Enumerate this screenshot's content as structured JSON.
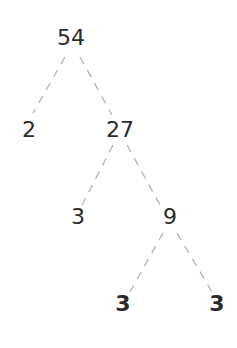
{
  "diagram": {
    "type": "factor-tree",
    "root": "54",
    "nodes": [
      {
        "id": "n54",
        "label": "54",
        "x": 71,
        "y": 38,
        "bold": false
      },
      {
        "id": "n2",
        "label": "2",
        "x": 29,
        "y": 130,
        "bold": false
      },
      {
        "id": "n27",
        "label": "27",
        "x": 120,
        "y": 130,
        "bold": false
      },
      {
        "id": "n3a",
        "label": "3",
        "x": 78,
        "y": 217,
        "bold": false
      },
      {
        "id": "n9",
        "label": "9",
        "x": 170,
        "y": 217,
        "bold": false
      },
      {
        "id": "n3b",
        "label": "3",
        "x": 123,
        "y": 304,
        "bold": true
      },
      {
        "id": "n3c",
        "label": "3",
        "x": 217,
        "y": 304,
        "bold": true
      }
    ],
    "edges": [
      {
        "from": "54",
        "to": "2",
        "x1": 65,
        "y1": 57,
        "x2": 33,
        "y2": 113
      },
      {
        "from": "54",
        "to": "27",
        "x1": 80,
        "y1": 57,
        "x2": 112,
        "y2": 115
      },
      {
        "from": "27",
        "to": "3",
        "x1": 113,
        "y1": 145,
        "x2": 82,
        "y2": 205
      },
      {
        "from": "27",
        "to": "9",
        "x1": 127,
        "y1": 145,
        "x2": 160,
        "y2": 205
      },
      {
        "from": "9",
        "to": "3",
        "x1": 163,
        "y1": 233,
        "x2": 130,
        "y2": 292
      },
      {
        "from": "9",
        "to": "3",
        "x1": 177,
        "y1": 233,
        "x2": 212,
        "y2": 292
      }
    ],
    "prime_factors": [
      "2",
      "3",
      "3",
      "3"
    ],
    "colors": {
      "text": "#2b2b2b",
      "edge": "#b4b4b4",
      "background": "#ffffff"
    }
  }
}
